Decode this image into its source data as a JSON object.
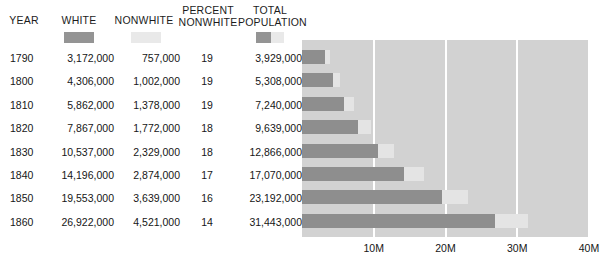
{
  "table": {
    "headers": {
      "year": "YEAR",
      "white": "WHITE",
      "nonwhite": "NONWHITE",
      "percent_nonwhite": "PERCENT\nNONWHITE",
      "total_population": "TOTAL\nPOPULATION"
    },
    "rows": [
      {
        "year": "1790",
        "white": "3,172,000",
        "nonwhite": "757,000",
        "percent_nonwhite": "19",
        "total": "3,929,000"
      },
      {
        "year": "1800",
        "white": "4,306,000",
        "nonwhite": "1,002,000",
        "percent_nonwhite": "19",
        "total": "5,308,000"
      },
      {
        "year": "1810",
        "white": "5,862,000",
        "nonwhite": "1,378,000",
        "percent_nonwhite": "19",
        "total": "7,240,000"
      },
      {
        "year": "1820",
        "white": "7,867,000",
        "nonwhite": "1,772,000",
        "percent_nonwhite": "18",
        "total": "9,639,000"
      },
      {
        "year": "1830",
        "white": "10,537,000",
        "nonwhite": "2,329,000",
        "percent_nonwhite": "18",
        "total": "12,866,000"
      },
      {
        "year": "1840",
        "white": "14,196,000",
        "nonwhite": "2,874,000",
        "percent_nonwhite": "17",
        "total": "17,070,000"
      },
      {
        "year": "1850",
        "white": "19,553,000",
        "nonwhite": "3,639,000",
        "percent_nonwhite": "16",
        "total": "23,192,000"
      },
      {
        "year": "1860",
        "white": "26,922,000",
        "nonwhite": "4,521,000",
        "percent_nonwhite": "14",
        "total": "31,443,000"
      }
    ]
  },
  "legend": {
    "white_swatch_color": "#949494",
    "nonwhite_swatch_color": "#e9e9e9"
  },
  "colors": {
    "plot_background": "#d2d2d2",
    "gridline": "#ffffff",
    "white_bar": "#8e8e8e",
    "nonwhite_bar": "#e4e4e4",
    "text": "#161616"
  },
  "chart_data": {
    "type": "bar",
    "orientation": "horizontal",
    "stacked": true,
    "title": "",
    "xlabel": "",
    "ylabel": "",
    "categories": [
      "1790",
      "1800",
      "1810",
      "1820",
      "1830",
      "1840",
      "1850",
      "1860"
    ],
    "series": [
      {
        "name": "WHITE",
        "values": [
          3172000,
          4306000,
          5862000,
          7867000,
          10537000,
          14196000,
          19553000,
          26922000
        ]
      },
      {
        "name": "NONWHITE",
        "values": [
          757000,
          1002000,
          1378000,
          1772000,
          2329000,
          2874000,
          3639000,
          4521000
        ]
      }
    ],
    "totals": [
      3929000,
      5308000,
      7240000,
      9639000,
      12866000,
      17070000,
      23192000,
      31443000
    ],
    "percent_nonwhite": [
      19,
      19,
      19,
      18,
      18,
      17,
      16,
      14
    ],
    "xlim": [
      0,
      40000000
    ],
    "xticks": [
      10000000,
      20000000,
      30000000,
      40000000
    ],
    "xtick_labels": [
      "10M",
      "20M",
      "30M",
      "40M"
    ],
    "grid": true,
    "legend_position": "top-header"
  }
}
